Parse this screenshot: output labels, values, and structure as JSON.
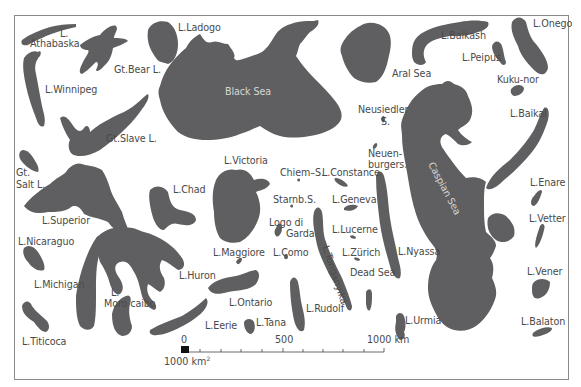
{
  "map": {
    "title": "Comparative sizes of the world's major lakes",
    "lake_color": "#5f5f61",
    "background": "#ffffff",
    "labels": [
      {
        "id": "athabaska-1",
        "text": "L.",
        "x": 60,
        "y": 28
      },
      {
        "id": "athabaska-2",
        "text": "Athabaska",
        "x": 30,
        "y": 38
      },
      {
        "id": "gt-bear",
        "text": "Gt.Bear L.",
        "x": 114,
        "y": 64
      },
      {
        "id": "ladogo",
        "text": "L.Ladogo",
        "x": 178,
        "y": 22
      },
      {
        "id": "winnipeg",
        "text": "L.Winnipeg",
        "x": 45,
        "y": 84
      },
      {
        "id": "gt-slave",
        "text": "Gt.Slave L.",
        "x": 106,
        "y": 133
      },
      {
        "id": "gt-salt-1",
        "text": "Gt.",
        "x": 16,
        "y": 167
      },
      {
        "id": "gt-salt-2",
        "text": "Salt L.",
        "x": 16,
        "y": 179
      },
      {
        "id": "superior",
        "text": "L.Superior",
        "x": 42,
        "y": 215
      },
      {
        "id": "chad",
        "text": "L.Chad",
        "x": 173,
        "y": 184
      },
      {
        "id": "nicaraguo",
        "text": "L.Nicaraguo",
        "x": 18,
        "y": 236
      },
      {
        "id": "michigan",
        "text": "L.Michigan",
        "x": 34,
        "y": 279
      },
      {
        "id": "moroc-1",
        "text": "L.",
        "x": 111,
        "y": 287
      },
      {
        "id": "moroc-2",
        "text": "Moro caibo",
        "x": 104,
        "y": 298
      },
      {
        "id": "huron",
        "text": "L.Huron",
        "x": 179,
        "y": 270
      },
      {
        "id": "titicoca",
        "text": "L.Titicoca",
        "x": 22,
        "y": 336
      },
      {
        "id": "victoria",
        "text": "L.Victoria",
        "x": 224,
        "y": 155
      },
      {
        "id": "black-sea",
        "text": "Black Sea",
        "x": 225,
        "y": 86,
        "inner": true
      },
      {
        "id": "chiem",
        "text": "Chiem–S.",
        "x": 280,
        "y": 167
      },
      {
        "id": "constance",
        "text": "L.Constance",
        "x": 322,
        "y": 167
      },
      {
        "id": "starnb",
        "text": "Starnb.S.",
        "x": 273,
        "y": 194
      },
      {
        "id": "geneva",
        "text": "L.Geneva",
        "x": 332,
        "y": 194
      },
      {
        "id": "logo",
        "text": "Logo di",
        "x": 269,
        "y": 217
      },
      {
        "id": "garda",
        "text": "Garda",
        "x": 286,
        "y": 228
      },
      {
        "id": "lucerne",
        "text": "L.Lucerne",
        "x": 332,
        "y": 224
      },
      {
        "id": "maggiore",
        "text": "L.Maggiore",
        "x": 213,
        "y": 247
      },
      {
        "id": "como",
        "text": "L.Como",
        "x": 273,
        "y": 247
      },
      {
        "id": "zurich",
        "text": "L.Zürich",
        "x": 342,
        "y": 247
      },
      {
        "id": "ontario",
        "text": "L.Ontario",
        "x": 229,
        "y": 297
      },
      {
        "id": "eerie",
        "text": "L.Eerie",
        "x": 205,
        "y": 320
      },
      {
        "id": "tana",
        "text": "L.Tana",
        "x": 256,
        "y": 317
      },
      {
        "id": "rudolf",
        "text": "L.Rudolf",
        "x": 306,
        "y": 303
      },
      {
        "id": "tonganyika",
        "text": "L.Tonganyika",
        "x": 331,
        "y": 244,
        "rot": "tang"
      },
      {
        "id": "dead-sea",
        "text": "Dead Sea",
        "x": 350,
        "y": 267
      },
      {
        "id": "neusiedler-1",
        "text": "Neusiedler",
        "x": 358,
        "y": 104
      },
      {
        "id": "neusiedler-2",
        "text": "S.",
        "x": 381,
        "y": 116
      },
      {
        "id": "neuen-1",
        "text": "Neuen-",
        "x": 368,
        "y": 148
      },
      {
        "id": "neuen-2",
        "text": "burgers.",
        "x": 368,
        "y": 159
      },
      {
        "id": "aral",
        "text": "Aral Sea",
        "x": 392,
        "y": 68
      },
      {
        "id": "nyassa",
        "text": "L.Nyassa",
        "x": 398,
        "y": 246
      },
      {
        "id": "urmia",
        "text": "L.Urmia",
        "x": 405,
        "y": 315
      },
      {
        "id": "caspian",
        "text": "Caspian Sea",
        "x": 436,
        "y": 160,
        "inner": true,
        "rot": "casp"
      },
      {
        "id": "balkash",
        "text": "L.Balkash",
        "x": 441,
        "y": 30
      },
      {
        "id": "peipus",
        "text": "L.Peipus",
        "x": 462,
        "y": 52
      },
      {
        "id": "onego",
        "text": "L.Onego",
        "x": 533,
        "y": 18
      },
      {
        "id": "kuku-nor",
        "text": "Kuku-nor",
        "x": 497,
        "y": 74
      },
      {
        "id": "baikal",
        "text": "L.Baikal",
        "x": 510,
        "y": 108
      },
      {
        "id": "enare",
        "text": "L.Enare",
        "x": 530,
        "y": 177
      },
      {
        "id": "vetter",
        "text": "L.Vetter",
        "x": 529,
        "y": 213
      },
      {
        "id": "vener",
        "text": "L.Vener",
        "x": 527,
        "y": 266
      },
      {
        "id": "balaton",
        "text": "L.Balaton",
        "x": 521,
        "y": 316
      }
    ]
  },
  "scale_bar": {
    "label_start": "0",
    "label_mid": "500",
    "label_end": "1000 km",
    "area_label": "1000 km",
    "area_sup": "2"
  }
}
